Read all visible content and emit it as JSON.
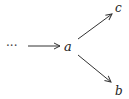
{
  "diagram": {
    "type": "commutative-diagram",
    "nodes": [
      {
        "id": "dots",
        "label": "···"
      },
      {
        "id": "a",
        "label": "a"
      },
      {
        "id": "c",
        "label": "c"
      },
      {
        "id": "b",
        "label": "b"
      }
    ],
    "edges": [
      {
        "from": "dots",
        "to": "a"
      },
      {
        "from": "a",
        "to": "c"
      },
      {
        "from": "a",
        "to": "b"
      }
    ],
    "colors": {
      "stroke": "#333333",
      "text": "#222222"
    }
  }
}
